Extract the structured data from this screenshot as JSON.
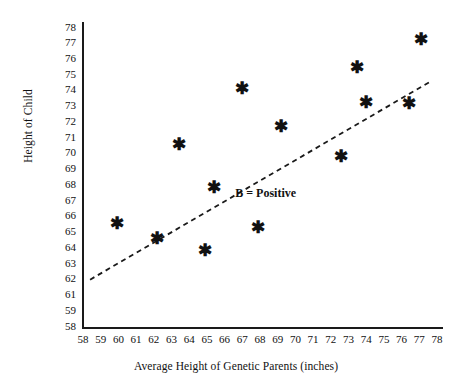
{
  "chart_data": {
    "type": "scatter",
    "title": "",
    "xlabel": "Average Height of Genetic Parents (inches)",
    "ylabel": "Height of Child",
    "xlim": [
      58,
      78
    ],
    "ylim": [
      58,
      78
    ],
    "grid": false,
    "legend": null,
    "marker_glyph": "✱",
    "xticks": [
      "58",
      "59",
      "60",
      "61",
      "62",
      "63",
      "64",
      "65",
      "66",
      "67",
      "68",
      "69",
      "70",
      "71",
      "72",
      "73",
      "74",
      "75",
      "76",
      "77",
      "78"
    ],
    "yticks": [
      "78",
      "77",
      "76",
      "75",
      "74",
      "73",
      "72",
      "71",
      "70",
      "69",
      "68",
      "67",
      "66",
      "65",
      "64",
      "63",
      "62",
      "61",
      "59",
      "58"
    ],
    "points": [
      {
        "x": 59.9,
        "y": 64.9
      },
      {
        "x": 62.2,
        "y": 63.9
      },
      {
        "x": 63.4,
        "y": 70.2
      },
      {
        "x": 64.9,
        "y": 63.1
      },
      {
        "x": 65.4,
        "y": 67.3
      },
      {
        "x": 67.0,
        "y": 73.9
      },
      {
        "x": 67.9,
        "y": 64.6
      },
      {
        "x": 69.2,
        "y": 71.4
      },
      {
        "x": 72.6,
        "y": 69.4
      },
      {
        "x": 73.5,
        "y": 75.3
      },
      {
        "x": 74.0,
        "y": 73.0
      },
      {
        "x": 76.4,
        "y": 72.9
      },
      {
        "x": 77.1,
        "y": 77.2
      }
    ],
    "trendline": {
      "style": "dashed",
      "x0": 58.4,
      "y0": 61.1,
      "x1": 77.7,
      "y1": 74.4
    },
    "annotations": [
      {
        "text": "B = Positive",
        "x": 66.6,
        "y": 66.9
      }
    ]
  }
}
